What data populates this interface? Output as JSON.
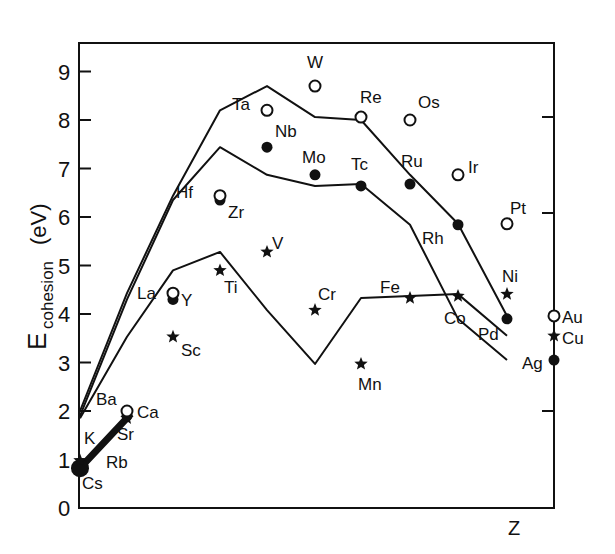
{
  "chart_data": {
    "type": "line",
    "title": "",
    "xlabel": "Z",
    "ylabel": "E_cohesion (eV)",
    "ylabel_main": "E",
    "ylabel_sub": "cohesion",
    "ylabel_unit": "(eV)",
    "ylim": [
      0,
      9.4
    ],
    "yticks": [
      0,
      1,
      2,
      3,
      4,
      5,
      6,
      7,
      8,
      9
    ],
    "right_ticks": [
      2,
      6,
      8
    ],
    "grid": false,
    "legend": "none (series identified by marker: star = 3d, filled circle = 4d, open circle = 5d)",
    "categories": [
      "group 1",
      "group 2",
      "group 3",
      "group 4",
      "group 5",
      "group 6",
      "group 7",
      "group 8",
      "group 9",
      "group 10",
      "group 11"
    ],
    "series": [
      {
        "name": "3d series",
        "marker": "star",
        "elements": [
          "K",
          "Ca",
          "Sc",
          "Ti",
          "V",
          "Cr",
          "Mn",
          "Fe",
          "Co",
          "Ni",
          "Cu"
        ],
        "values": [
          0.93,
          1.84,
          3.9,
          4.85,
          5.31,
          4.1,
          2.92,
          4.28,
          4.39,
          4.44,
          3.49
        ]
      },
      {
        "name": "4d series",
        "marker": "filled-circle",
        "elements": [
          "Rb",
          "Sr",
          "Y",
          "Zr",
          "Nb",
          "Mo",
          "Tc",
          "Ru",
          "Rh",
          "Pd",
          "Ag"
        ],
        "values": [
          0.85,
          1.72,
          4.37,
          6.25,
          7.57,
          6.82,
          6.85,
          6.74,
          5.75,
          3.89,
          2.95
        ]
      },
      {
        "name": "5d series",
        "marker": "open-circle",
        "elements": [
          "Cs",
          "Ba",
          "La",
          "Hf",
          "Ta",
          "W",
          "Re",
          "Os",
          "Ir",
          "Pt",
          "Au"
        ],
        "values": [
          0.8,
          1.9,
          4.47,
          6.44,
          8.1,
          8.9,
          8.03,
          8.17,
          6.94,
          5.84,
          3.81
        ]
      }
    ],
    "plotted_positions": {
      "x_px": [
        80,
        127,
        173,
        220,
        267,
        315,
        361,
        410,
        458,
        507,
        554
      ],
      "star": [
        0.93,
        1.85,
        3.53,
        4.9,
        5.28,
        4.08,
        2.97,
        4.33,
        4.37,
        4.41,
        3.55
      ],
      "filled": [
        0.82,
        1.9,
        4.3,
        6.35,
        7.44,
        6.87,
        6.64,
        6.68,
        5.84,
        3.9,
        3.05
      ],
      "open": [
        0.82,
        2.0,
        4.43,
        6.44,
        8.2,
        8.7,
        8.06,
        8.0,
        6.87,
        5.86,
        3.96
      ]
    },
    "annotations": [
      "K",
      "Rb",
      "Cs",
      "Ba",
      "Ca",
      "Sr",
      "La",
      "Y",
      "Sc",
      "Hf",
      "Zr",
      "Ti",
      "Ta",
      "Nb",
      "V",
      "W",
      "Mo",
      "Cr",
      "Re",
      "Tc",
      "Mn",
      "Os",
      "Ru",
      "Fe",
      "Ir",
      "Rh",
      "Co",
      "Pt",
      "Pd",
      "Ni",
      "Au",
      "Cu",
      "Ag"
    ]
  },
  "labels": {
    "y_ticks": [
      "0",
      "1",
      "2",
      "3",
      "4",
      "5",
      "6",
      "7",
      "8",
      "9"
    ],
    "x_axis": "Z",
    "y_main": "E",
    "y_sub": "cohesion",
    "y_unit": "(eV)"
  }
}
